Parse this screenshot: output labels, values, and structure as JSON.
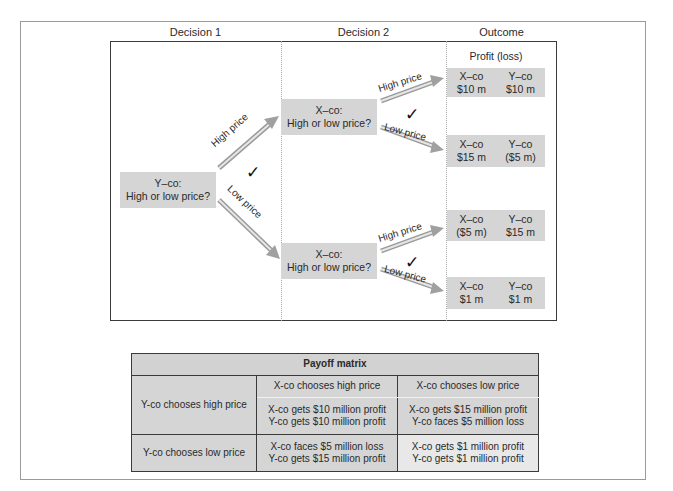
{
  "columns": {
    "decision1": "Decision 1",
    "decision2": "Decision 2",
    "outcome": "Outcome"
  },
  "tree": {
    "root": {
      "line1": "Y–co:",
      "line2": "High or low price?"
    },
    "root_branches": [
      {
        "label": "High price",
        "chosen": false
      },
      {
        "label": "Low price",
        "chosen": true
      }
    ],
    "x_nodes": [
      {
        "line1": "X–co:",
        "line2": "High or low price?",
        "branches": [
          {
            "label": "High price",
            "chosen": false
          },
          {
            "label": "Low price",
            "chosen": true
          }
        ]
      },
      {
        "line1": "X–co:",
        "line2": "High or low price?",
        "branches": [
          {
            "label": "High price",
            "chosen": false
          },
          {
            "label": "Low price",
            "chosen": true
          }
        ]
      }
    ],
    "check_symbol": "✓",
    "profit_label": "Profit (loss)",
    "outcomes": [
      {
        "x_label": "X–co",
        "x_value": "$10 m",
        "y_label": "Y–co",
        "y_value": "$10 m"
      },
      {
        "x_label": "X–co",
        "x_value": "$15 m",
        "y_label": "Y–co",
        "y_value": "($5 m)"
      },
      {
        "x_label": "X–co",
        "x_value": "($5 m)",
        "y_label": "Y–co",
        "y_value": "$15 m"
      },
      {
        "x_label": "X–co",
        "x_value": "$1 m",
        "y_label": "Y–co",
        "y_value": "$1 m"
      }
    ]
  },
  "payoff_matrix": {
    "title": "Payoff matrix",
    "col_headers": [
      "X-co chooses high price",
      "X-co chooses low price"
    ],
    "rows": [
      {
        "header": "Y-co chooses high price",
        "cells": [
          [
            "X-co gets $10 million profit",
            "Y-co gets $10 million profit"
          ],
          [
            "X-co gets $15 million profit",
            "Y-co faces $5 million loss"
          ]
        ]
      },
      {
        "header": "Y-co chooses low price",
        "cells": [
          [
            "X-co faces $5 million loss",
            "Y-co gets $15 million profit"
          ],
          [
            "X-co gets $1 million profit",
            "Y-co gets $1 million profit"
          ]
        ]
      }
    ]
  },
  "colors": {
    "box_fill": "#d5d5d5",
    "equilibrium_fill": "#e8e8e8",
    "arrow": "#a8a8a8",
    "border": "#3a3a3a"
  }
}
